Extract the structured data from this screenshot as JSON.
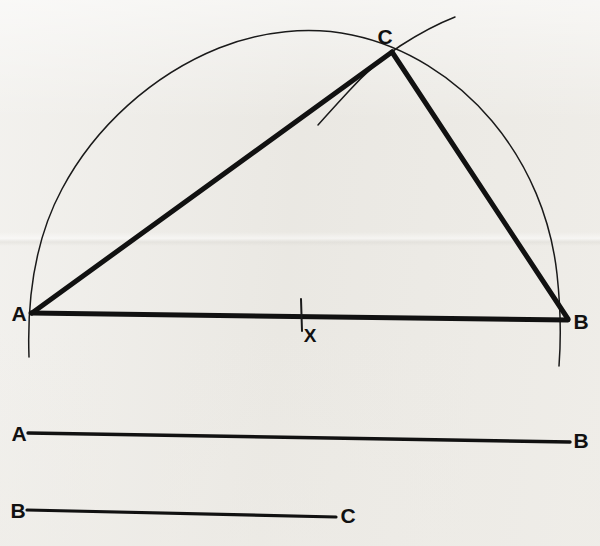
{
  "figure": {
    "background_color": "#eceae5",
    "ink_color": "#111111",
    "thick_stroke_width": 5,
    "thin_stroke_width": 1.4
  },
  "labels": {
    "vertex_a": "A",
    "vertex_b": "B",
    "vertex_c": "C",
    "midpoint_x": "X",
    "ref_ab_left": "A",
    "ref_ab_right": "B",
    "ref_bc_left": "B",
    "ref_bc_right": "C"
  },
  "points": {
    "A": {
      "x": 32,
      "y": 314
    },
    "B": {
      "x": 568,
      "y": 320
    },
    "C": {
      "x": 392,
      "y": 52
    },
    "X": {
      "x": 301,
      "y": 316
    }
  },
  "label_positions": {
    "A": {
      "x": 19,
      "y": 321
    },
    "B": {
      "x": 581,
      "y": 329
    },
    "C": {
      "x": 385,
      "y": 44
    },
    "X": {
      "x": 310,
      "y": 342
    },
    "ref_ab_left": {
      "x": 19,
      "y": 441
    },
    "ref_ab_right": {
      "x": 581,
      "y": 448
    },
    "ref_bc_left": {
      "x": 18,
      "y": 518
    },
    "ref_bc_right": {
      "x": 348,
      "y": 523
    }
  },
  "elements": {
    "baseline_ab": {
      "name": "segment-ab-base",
      "from": "A",
      "to": "B",
      "weight": "thick"
    },
    "side_ac": {
      "name": "segment-ac",
      "from": "A",
      "to": "C",
      "weight": "thick"
    },
    "side_cb": {
      "name": "segment-cb",
      "from": "C",
      "to": "B",
      "weight": "thick"
    },
    "main_arc": {
      "name": "semicircle-arc-through-c",
      "weight": "thin",
      "center_x": 301,
      "center_y": 322,
      "radius": 272
    },
    "construction_arc": {
      "name": "construction-arc-at-c",
      "weight": "thin"
    },
    "tick_x": {
      "name": "tick-mark-x",
      "x": 301,
      "top_y": 300,
      "bottom_y": 331
    }
  },
  "reference_segments": {
    "ab": {
      "name": "reference-segment-ab",
      "left_label": "A",
      "right_label": "B",
      "x1": 28,
      "y1": 433,
      "x2": 570,
      "y2": 442,
      "weight": "medium"
    },
    "bc": {
      "name": "reference-segment-bc",
      "left_label": "B",
      "right_label": "C",
      "x1": 27,
      "y1": 510,
      "x2": 336,
      "y2": 517,
      "weight": "medium"
    }
  }
}
